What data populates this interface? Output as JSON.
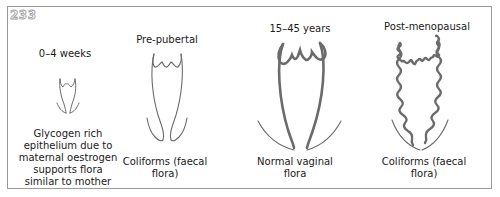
{
  "figure": {
    "number": "233",
    "panels": [
      {
        "title": "0–4 weeks",
        "caption_lines": [
          "Glycogen rich",
          "epithelium due to",
          "maternal oestrogen",
          "supports flora",
          "similar to mother"
        ],
        "epithelium": "thin"
      },
      {
        "title": "Pre-pubertal",
        "caption_lines": [
          "Coliforms (faecal",
          "flora)"
        ],
        "epithelium": "thin"
      },
      {
        "title": "15–45 years",
        "caption_lines": [
          "Normal vaginal",
          "flora"
        ],
        "epithelium": "thick"
      },
      {
        "title": "Post-menopausal",
        "caption_lines": [
          "Coliforms (faecal",
          "flora)"
        ],
        "epithelium": "atrophic-wavy"
      }
    ]
  },
  "colors": {
    "stroke": "#6b6b6b",
    "border": "#9a9a9a",
    "text": "#1a1a1a"
  }
}
